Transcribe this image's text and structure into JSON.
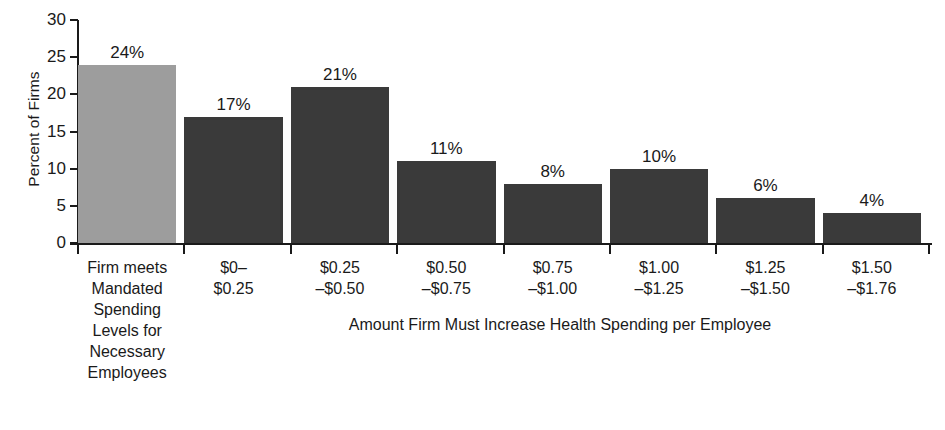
{
  "chart_data": {
    "type": "bar",
    "title": "",
    "xlabel": "Amount Firm Must Increase Health Spending per Employee",
    "ylabel": "Percent of Firms",
    "ylim": [
      0,
      30
    ],
    "yticks": [
      0,
      5,
      10,
      15,
      20,
      25,
      30
    ],
    "ytick_labels": [
      "0",
      "5",
      "10",
      "15",
      "20",
      "25",
      "30"
    ],
    "grid": false,
    "legend": "none",
    "categories": [
      "Firm meets Mandated Spending Levels for Necessary Employees",
      "$0–$0.25",
      "$0.25–$0.50",
      "$0.50–$0.75",
      "$0.75–$1.00",
      "$1.00–$1.25",
      "$1.25–$1.50",
      "$1.50–$1.76"
    ],
    "category_label_lines": [
      [
        "Firm meets",
        "Mandated",
        "Spending",
        "Levels for",
        "Necessary",
        "Employees"
      ],
      [
        "$0–",
        "$0.25"
      ],
      [
        "$0.25",
        "–$0.50"
      ],
      [
        "$0.50",
        "–$0.75"
      ],
      [
        "$0.75",
        "–$1.00"
      ],
      [
        "$1.00",
        "–$1.25"
      ],
      [
        "$1.25",
        "–$1.50"
      ],
      [
        "$1.50",
        "–$1.76"
      ]
    ],
    "values": [
      24,
      17,
      21,
      11,
      8,
      10,
      6,
      4
    ],
    "value_labels": [
      "24%",
      "17%",
      "21%",
      "11%",
      "8%",
      "10%",
      "6%",
      "4%"
    ],
    "bar_colors": [
      "#9d9d9d",
      "#3a3a3a",
      "#3a3a3a",
      "#3a3a3a",
      "#3a3a3a",
      "#3a3a3a",
      "#3a3a3a",
      "#3a3a3a"
    ],
    "highlight_index": 0
  },
  "axis": {
    "y_title": "Percent of Firms",
    "x_title": "Amount Firm Must Increase Health Spending per Employee"
  }
}
